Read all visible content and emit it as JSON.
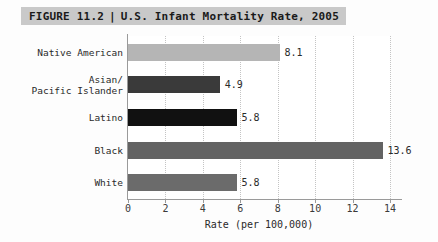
{
  "figure": {
    "label": "FIGURE 11.2",
    "separator": "|",
    "title": "U.S. Infant Mortality Rate, 2005",
    "band_color": "#c9c9c9"
  },
  "chart_data": {
    "type": "bar",
    "orientation": "horizontal",
    "title": "U.S. Infant Mortality Rate, 2005",
    "xlabel": "Rate (per 100,000)",
    "ylabel": "",
    "xlim": [
      0,
      14
    ],
    "xticks": [
      0,
      2,
      4,
      6,
      8,
      10,
      12,
      14
    ],
    "xtick_labels": [
      "0",
      "2",
      "4",
      "6",
      "8",
      "10",
      "12",
      "14"
    ],
    "grid": "vertical-dotted",
    "legend": "none",
    "categories": [
      "Native American",
      "Asian/\nPacific Islander",
      "Latino",
      "Black",
      "White"
    ],
    "values": [
      8.1,
      4.9,
      5.8,
      13.6,
      5.8
    ],
    "value_labels": [
      "8.1",
      "4.9",
      "5.8",
      "13.6",
      "5.8"
    ],
    "bar_colors": [
      "#b5b5b5",
      "#3a3a3a",
      "#111111",
      "#636363",
      "#6b6b6b"
    ]
  }
}
